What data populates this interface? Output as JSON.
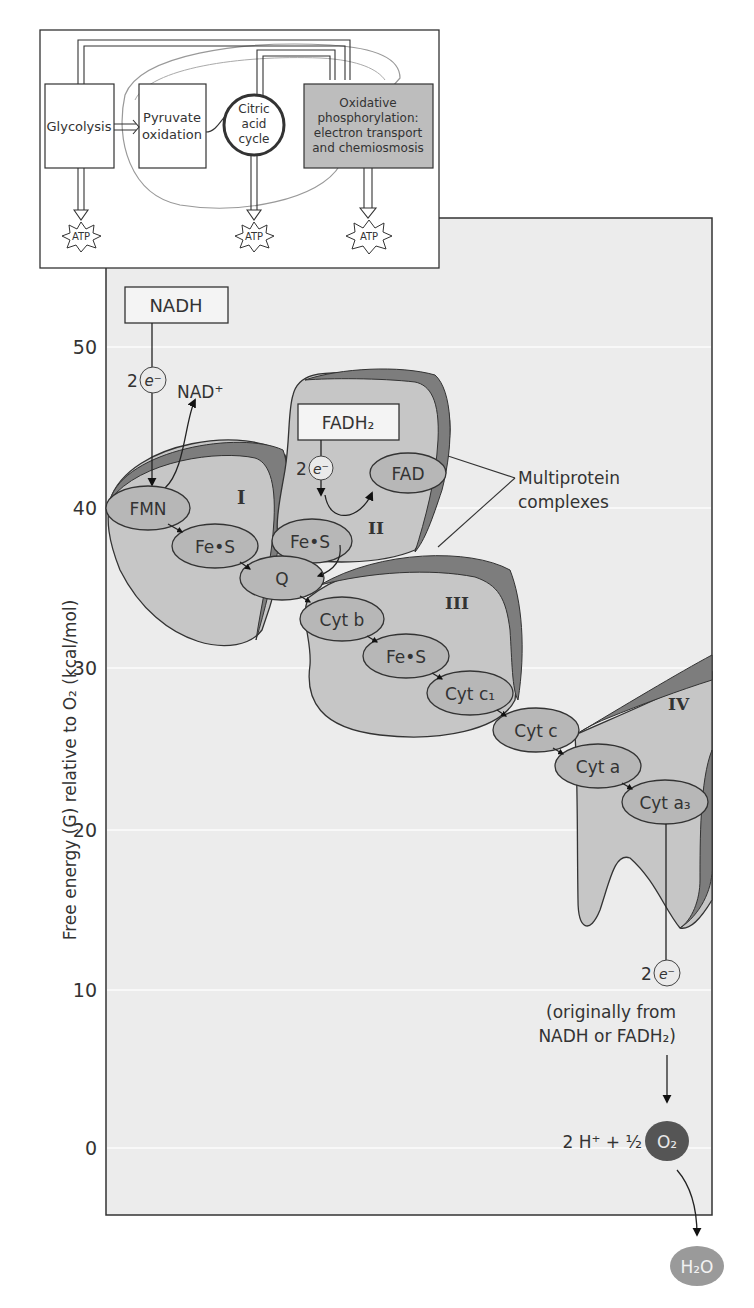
{
  "inset": {
    "glycolysis": "Glycolysis",
    "pyruvate_oxidation_1": "Pyruvate",
    "pyruvate_oxidation_2": "oxidation",
    "citric_acid_1": "Citric",
    "citric_acid_2": "acid",
    "citric_acid_3": "cycle",
    "oxphos_1": "Oxidative",
    "oxphos_2": "phosphorylation:",
    "oxphos_3": "electron transport",
    "oxphos_4": "and chemiosmosis",
    "atp": "ATP"
  },
  "axis": {
    "title": "Free energy (G) relative to O₂ (kcal/mol)",
    "ticks": [
      "50",
      "40",
      "30",
      "20",
      "10",
      "0"
    ]
  },
  "main": {
    "nadh": "NADH",
    "nad_plus": "NAD⁺",
    "two_e": "2",
    "e_symbol": "e⁻",
    "fadh2": "FADH₂",
    "fad": "FAD",
    "fmn": "FMN",
    "fes": "Fe•S",
    "q": "Q",
    "cyt_b": "Cyt b",
    "cyt_c1": "Cyt c₁",
    "cyt_c": "Cyt c",
    "cyt_a": "Cyt a",
    "cyt_a3": "Cyt a₃",
    "complex_1": "I",
    "complex_2": "II",
    "complex_3": "III",
    "complex_4": "IV",
    "multiprotein_1": "Multiprotein",
    "multiprotein_2": "complexes",
    "origin_1": "(originally from",
    "origin_2": "NADH or FADH₂)",
    "reaction": "2 H⁺ + ½",
    "o2": "O₂",
    "h2o": "H₂O"
  },
  "colors": {
    "panel_bg": "#ececec",
    "complex_fill": "#c6c6c6",
    "carrier_fill": "#b7b7b7",
    "complex_band": "#7d7d7d",
    "oxphos_box": "#bdbdbd",
    "o2_fill": "#555555",
    "h2o_fill": "#9a9a9a"
  }
}
